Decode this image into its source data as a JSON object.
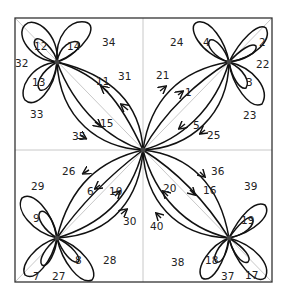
{
  "diagram": {
    "type": "directed multigraph with loops",
    "nodes": [
      {
        "id": "center",
        "x": 143,
        "y": 150
      },
      {
        "id": "top-left",
        "x": 57,
        "y": 62
      },
      {
        "id": "top-right",
        "x": 229,
        "y": 62
      },
      {
        "id": "bottom-left",
        "x": 57,
        "y": 238
      },
      {
        "id": "bottom-right",
        "x": 229,
        "y": 238
      }
    ],
    "labels": {
      "l1": "1",
      "l2": "2",
      "l3": "3",
      "l4": "4",
      "l5": "5",
      "l6": "6",
      "l7": "7",
      "l8": "8",
      "l9": "9",
      "l10": "10",
      "l11": "11",
      "l12": "12",
      "l13": "13",
      "l14": "14",
      "l15": "15",
      "l16": "16",
      "l17": "17",
      "l18": "18",
      "l19": "19",
      "l20": "20",
      "l21": "21",
      "l22": "22",
      "l23": "23",
      "l24": "24",
      "l25": "25",
      "l26": "26",
      "l27": "27",
      "l28": "28",
      "l29": "29",
      "l30": "30",
      "l31": "31",
      "l32": "32",
      "l33": "33",
      "l34": "34",
      "l35": "35",
      "l36": "36",
      "l37": "37",
      "l38": "38",
      "l39": "39",
      "l40": "40"
    },
    "colors": {
      "edge": "#111111",
      "guide": "#c8c8c8",
      "frame": "#333333"
    }
  }
}
